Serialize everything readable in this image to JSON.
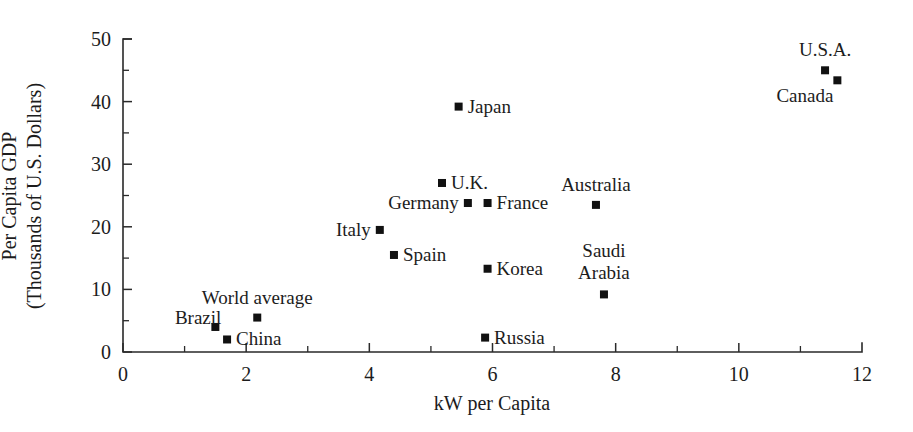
{
  "chart_data": {
    "type": "scatter",
    "title": "",
    "xlabel": "kW per Capita",
    "ylabel_line1": "Per Capita GDP",
    "ylabel_line2": "(Thousands of U.S. Dollars)",
    "xlim": [
      0,
      12
    ],
    "ylim": [
      0,
      50
    ],
    "xticks": [
      0,
      2,
      4,
      6,
      8,
      10,
      12
    ],
    "xticks_minor": [
      1,
      3,
      5,
      7,
      9,
      11
    ],
    "yticks": [
      0,
      10,
      20,
      30,
      40,
      50
    ],
    "yticks_minor": [
      5,
      15,
      25,
      35,
      45
    ],
    "xtick_labels": [
      "0",
      "2",
      "4",
      "6",
      "8",
      "10",
      "12"
    ],
    "ytick_labels": [
      "0",
      "10",
      "20",
      "30",
      "40",
      "50"
    ],
    "grid": false,
    "legend": "none",
    "marker": "square",
    "marker_color": "#111111",
    "points": [
      {
        "name": "U.S.A.",
        "x": 11.4,
        "y": 45.0,
        "label_pos": "above"
      },
      {
        "name": "Canada",
        "x": 11.6,
        "y": 43.4,
        "label_pos": "below-left"
      },
      {
        "name": "Japan",
        "x": 5.45,
        "y": 39.2,
        "label_pos": "right"
      },
      {
        "name": "U.K.",
        "x": 5.18,
        "y": 27.0,
        "label_pos": "right"
      },
      {
        "name": "Germany",
        "x": 5.6,
        "y": 23.8,
        "label_pos": "left"
      },
      {
        "name": "France",
        "x": 5.92,
        "y": 23.8,
        "label_pos": "right"
      },
      {
        "name": "Australia",
        "x": 7.68,
        "y": 23.5,
        "label_pos": "above"
      },
      {
        "name": "Italy",
        "x": 4.17,
        "y": 19.5,
        "label_pos": "left"
      },
      {
        "name": "Spain",
        "x": 4.4,
        "y": 15.5,
        "label_pos": "right"
      },
      {
        "name": "Korea",
        "x": 5.92,
        "y": 13.3,
        "label_pos": "right"
      },
      {
        "name": "Saudi Arabia",
        "x": 7.81,
        "y": 9.2,
        "label_pos": "above-two-line"
      },
      {
        "name": "World average",
        "x": 2.18,
        "y": 5.5,
        "label_pos": "above"
      },
      {
        "name": "Brazil",
        "x": 1.5,
        "y": 4.0,
        "label_pos": "above-left"
      },
      {
        "name": "China",
        "x": 1.69,
        "y": 2.0,
        "label_pos": "right"
      },
      {
        "name": "Russia",
        "x": 5.88,
        "y": 2.3,
        "label_pos": "right"
      }
    ]
  }
}
